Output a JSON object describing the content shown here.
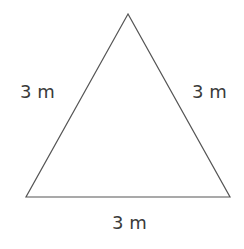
{
  "diagram": {
    "shape": "equilateral triangle",
    "vertices": [
      [
        128,
        14
      ],
      [
        26,
        197
      ],
      [
        230,
        197
      ]
    ],
    "stroke_color": "#555555",
    "labels": {
      "left_side": "3 m",
      "right_side": "3 m",
      "bottom_side": "3 m"
    }
  }
}
